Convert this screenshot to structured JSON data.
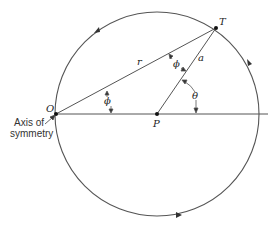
{
  "diagram": {
    "type": "geometric-construction",
    "colors": {
      "line": "#555555",
      "text": "#222222"
    },
    "points": {
      "O": {
        "label": "O",
        "x": 56,
        "y": 114
      },
      "P": {
        "label": "P",
        "x": 157,
        "y": 114
      },
      "T": {
        "label": "T",
        "x": 216,
        "y": 28
      }
    },
    "segments": {
      "OT": {
        "label": "r"
      },
      "PT": {
        "label": "a"
      }
    },
    "angles": {
      "at_O": {
        "label": "ϕ"
      },
      "at_T": {
        "label": "ϕ"
      },
      "at_P": {
        "label": "θ"
      }
    },
    "annotation": {
      "line1": "Axis of",
      "line2": "symmetry"
    },
    "circle_direction": "counter-clockwise arrows"
  }
}
